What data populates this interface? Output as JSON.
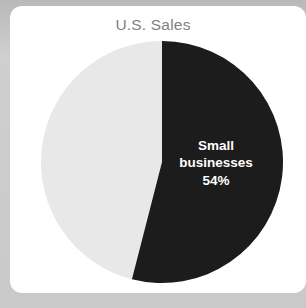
{
  "card": {
    "background_color": "#ffffff",
    "page_background_color": "#c9c9c9"
  },
  "chart_data": {
    "type": "pie",
    "title": "U.S. Sales",
    "xlabel": "",
    "ylabel": "",
    "legend": false,
    "legend_position": "none",
    "grid": false,
    "start_angle_deg": 0,
    "direction": "clockwise",
    "categories": [
      "Small businesses",
      "Other"
    ],
    "values": [
      54,
      46
    ],
    "labels_shown": [
      "Small businesses\n54%",
      ""
    ],
    "colors": [
      "#1c1c1c",
      "#e8e8e8"
    ],
    "title_color": "#808080",
    "label_color": "#ffffff",
    "slices": [
      {
        "name": "Small businesses",
        "value": 54,
        "display_value": "54%",
        "color": "#1c1c1c",
        "label_line_1": "Small",
        "label_line_2": "businesses",
        "label_line_3": "54%",
        "label_inside": true
      },
      {
        "name": "Other",
        "value": 46,
        "display_value": "46%",
        "color": "#e8e8e8",
        "label_inside": false
      }
    ]
  }
}
